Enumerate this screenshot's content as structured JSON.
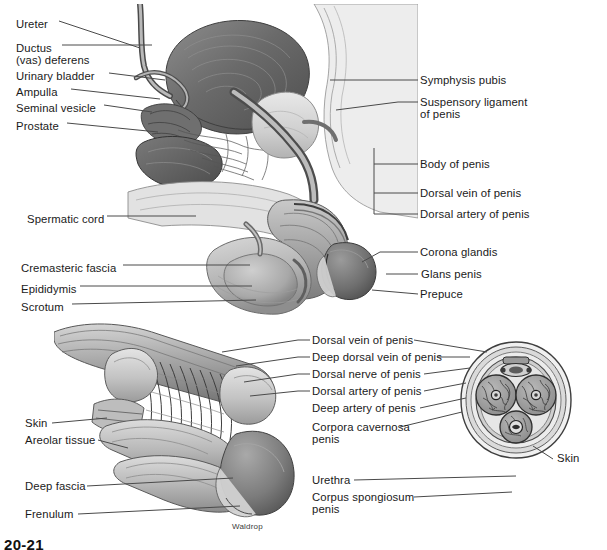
{
  "figure": {
    "number": "20-21",
    "credit": "Waldrop",
    "background_color": "#ffffff",
    "ink_color": "#1a1a1a",
    "leader_color": "#4a4a4a"
  },
  "upper_figure": {
    "name": "sagittal-section-male-pelvis",
    "labels_left": [
      {
        "text": "Ureter",
        "x": 16,
        "y": 18
      },
      {
        "text": "Ductus",
        "x": 16,
        "y": 42
      },
      {
        "text": "(vas) deferens",
        "x": 16,
        "y": 54
      },
      {
        "text": "Urinary bladder",
        "x": 16,
        "y": 70
      },
      {
        "text": "Ampulla",
        "x": 16,
        "y": 86
      },
      {
        "text": "Seminal vesicle",
        "x": 16,
        "y": 102
      },
      {
        "text": "Prostate",
        "x": 16,
        "y": 120
      },
      {
        "text": "Spermatic cord",
        "x": 27,
        "y": 213
      },
      {
        "text": "Cremasteric fascia",
        "x": 21,
        "y": 262
      },
      {
        "text": "Epididymis",
        "x": 21,
        "y": 283
      },
      {
        "text": "Scrotum",
        "x": 21,
        "y": 301
      }
    ],
    "labels_right": [
      {
        "text": "Symphysis pubis",
        "x": 420,
        "y": 77
      },
      {
        "text": "Suspensory ligament",
        "x": 420,
        "y": 99
      },
      {
        "text": "of penis",
        "x": 420,
        "y": 111
      },
      {
        "text": "Body of penis",
        "x": 420,
        "y": 161
      },
      {
        "text": "Dorsal vein of penis",
        "x": 420,
        "y": 190
      },
      {
        "text": "Dorsal artery of penis",
        "x": 420,
        "y": 211
      },
      {
        "text": "Corona glandis",
        "x": 420,
        "y": 249
      },
      {
        "text": "Glans penis",
        "x": 421,
        "y": 271
      },
      {
        "text": "Prepuce",
        "x": 420,
        "y": 291
      }
    ]
  },
  "lower_figure": {
    "name": "penis-longitudinal-and-cross-section",
    "labels_left": [
      {
        "text": "Skin",
        "x": 25,
        "y": 420
      },
      {
        "text": "Areolar tissue",
        "x": 25,
        "y": 437
      },
      {
        "text": "Deep fascia",
        "x": 25,
        "y": 483
      },
      {
        "text": "Frenulum",
        "x": 25,
        "y": 511
      }
    ],
    "labels_middle": [
      {
        "text": "Dorsal vein of penis",
        "x": 312,
        "y": 337
      },
      {
        "text": "Deep dorsal vein of penis",
        "x": 312,
        "y": 354
      },
      {
        "text": "Dorsal nerve of penis",
        "x": 312,
        "y": 371
      },
      {
        "text": "Dorsal artery of penis",
        "x": 312,
        "y": 388
      },
      {
        "text": "Deep artery of penis",
        "x": 312,
        "y": 405
      },
      {
        "text": "Corpora cavernosa",
        "x": 312,
        "y": 424
      },
      {
        "text": "penis",
        "x": 312,
        "y": 436
      },
      {
        "text": "Urethra",
        "x": 312,
        "y": 477
      },
      {
        "text": "Corpus spongiosum",
        "x": 312,
        "y": 494
      },
      {
        "text": "penis",
        "x": 312,
        "y": 506
      }
    ],
    "labels_right": [
      {
        "text": "Skin",
        "x": 557,
        "y": 456
      }
    ]
  }
}
